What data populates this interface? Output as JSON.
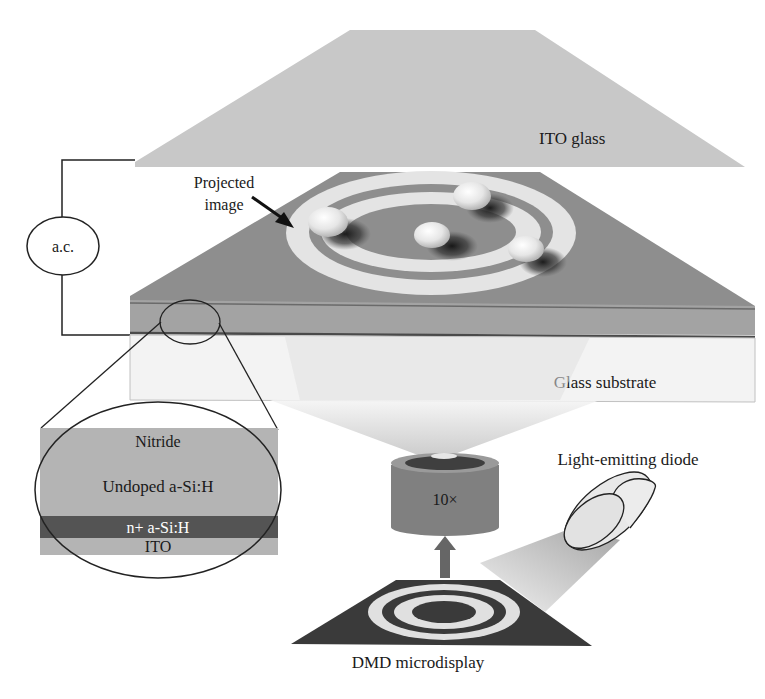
{
  "figure": {
    "labels": {
      "ito_glass": "ITO glass",
      "projected_image": "Projected",
      "projected_image_line2": "image",
      "ac_source": "a.c.",
      "glass_substrate": "Glass substrate",
      "nitride": "Nitride",
      "undoped": "Undoped a-Si:H",
      "n_plus": "n+ a-Si:H",
      "ito_layer": "ITO",
      "objective": "10×",
      "led": "Light-emitting diode",
      "dmd": "DMD microdisplay"
    },
    "colors": {
      "ito_glass": "#c8c8c8",
      "photoconductor_top": "#8c8c8c",
      "photoconductor_side": "#9a9a9a",
      "dark_layer": "#555555",
      "glass_substrate": "#f2f2f2",
      "ring_light": "#e4e4e4",
      "dmd_dark": "#3a3a3a",
      "objective": "#808080",
      "light_cone": "#d8d8d8",
      "outline": "#222222"
    }
  }
}
